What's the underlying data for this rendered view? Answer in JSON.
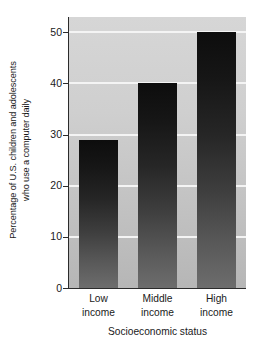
{
  "chart_data": {
    "type": "bar",
    "title": "",
    "subtitle": "",
    "categories": [
      "Low income",
      "Middle income",
      "High income"
    ],
    "category_lines": [
      [
        "Low",
        "income"
      ],
      [
        "Middle",
        "income"
      ],
      [
        "High",
        "income"
      ]
    ],
    "values": [
      29,
      40,
      50
    ],
    "xlabel": "Socioeconomic status",
    "ylabel_line1": "Percentage of U.S. children and adolescents",
    "ylabel_line2": "who use a computer daily",
    "ylabel": "Percentage of U.S. children and adolescents who use a computer daily",
    "ylim": [
      0,
      53
    ],
    "yticks": [
      0,
      10,
      20,
      30,
      40,
      50
    ],
    "ytick_labels": [
      "0",
      "10",
      "20",
      "30",
      "40",
      "50"
    ],
    "gridlines": [
      10,
      20,
      30,
      40,
      50
    ],
    "grid": true,
    "grid_color": "#f4f4f4",
    "legend": null,
    "legend_position": "none",
    "bar_color_top": "#0d0d0d",
    "bar_color_bottom": "#6d6d6d",
    "plot_background_top": "#d6d6d6",
    "plot_background_bottom": "#b6b6b6",
    "axis_color": "#2b2b2b",
    "text_color": "#1a1a1a"
  }
}
